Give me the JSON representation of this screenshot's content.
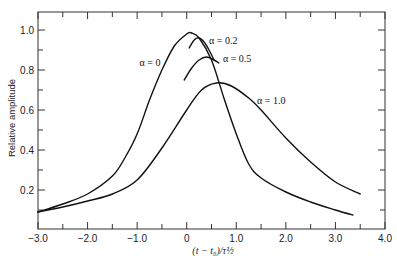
{
  "chart_data": {
    "type": "line",
    "title": "",
    "xlabel": "(t − t₀)/τ½",
    "ylabel": "Relative amplitude",
    "xlim": [
      -3.0,
      4.0
    ],
    "ylim": [
      0,
      1.09
    ],
    "grid": false,
    "legend_position": "inline labels",
    "x_ticks": [
      -3.0,
      -2.0,
      -1.0,
      0,
      1.0,
      2.0,
      3.0,
      4.0
    ],
    "x_tick_labels": [
      "−3.0",
      "−2.0",
      "−1.0",
      "0",
      "1.0",
      "2.0",
      "3.0",
      "4.0"
    ],
    "x_minor_ticks": [
      -2.5,
      -1.5,
      -0.5,
      0.5,
      1.5,
      2.5,
      3.5
    ],
    "y_ticks": [
      0.2,
      0.4,
      0.6,
      0.8,
      1.0
    ],
    "y_tick_labels": [
      "0.2",
      "0.4",
      "0.6",
      "0.8",
      "1.0"
    ],
    "y_minor_ticks": [
      0.1,
      0.3,
      0.5,
      0.7,
      0.9
    ],
    "series": [
      {
        "name": "α = 0",
        "label_pos": [
          -0.95,
          0.82
        ],
        "x": [
          -3.0,
          -2.5,
          -2.0,
          -1.5,
          -1.25,
          -1.0,
          -0.75,
          -0.5,
          -0.25,
          0.0,
          0.1,
          0.25,
          0.5,
          0.75,
          1.0,
          1.25,
          1.5,
          2.0,
          2.5,
          3.0,
          3.35
        ],
        "values": [
          0.09,
          0.13,
          0.18,
          0.27,
          0.36,
          0.48,
          0.65,
          0.8,
          0.92,
          0.98,
          0.985,
          0.96,
          0.85,
          0.66,
          0.48,
          0.33,
          0.26,
          0.19,
          0.14,
          0.1,
          0.075
        ]
      },
      {
        "name": "α = 0.2",
        "label_pos": [
          0.45,
          0.93
        ],
        "x": [
          0.05,
          0.15,
          0.25,
          0.35,
          0.45,
          0.55
        ],
        "values": [
          0.91,
          0.95,
          0.96,
          0.94,
          0.9,
          0.85
        ]
      },
      {
        "name": "α = 0.5",
        "label_pos": [
          0.73,
          0.84
        ],
        "x": [
          -0.05,
          0.1,
          0.25,
          0.4,
          0.55,
          0.65
        ],
        "values": [
          0.75,
          0.81,
          0.85,
          0.865,
          0.85,
          0.835
        ]
      },
      {
        "name": "α = 1.0",
        "label_pos": [
          1.42,
          0.63
        ],
        "x": [
          -3.0,
          -2.5,
          -2.0,
          -1.5,
          -1.0,
          -0.5,
          0.0,
          0.3,
          0.6,
          0.9,
          1.25,
          1.5,
          2.0,
          2.5,
          3.0,
          3.5
        ],
        "values": [
          0.09,
          0.115,
          0.145,
          0.18,
          0.25,
          0.41,
          0.6,
          0.7,
          0.735,
          0.72,
          0.66,
          0.6,
          0.46,
          0.34,
          0.24,
          0.18
        ]
      }
    ]
  },
  "labels": {
    "ylabel": "Relative amplitude",
    "xlabel": "(t − t₀)/τ½"
  }
}
